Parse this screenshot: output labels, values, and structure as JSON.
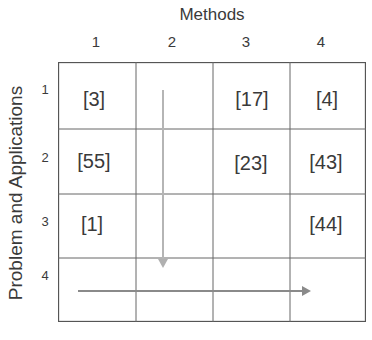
{
  "diagram": {
    "x_axis": {
      "title": "Methods",
      "labels": [
        "1",
        "2",
        "3",
        "4"
      ]
    },
    "y_axis": {
      "title": "Problem and Applications",
      "labels": [
        "1",
        "2",
        "3",
        "4"
      ]
    },
    "cells": {
      "r1c1": "[3]",
      "r1c3": "[17]",
      "r1c4": "[4]",
      "r2c1": "[55]",
      "r2c3": "[23]",
      "r2c4": "[43]",
      "r3c1": "[1]",
      "r3c4": "[44]"
    },
    "arrows": [
      {
        "name": "vertical-arrow",
        "direction": "down",
        "color": "#b0b0b0"
      },
      {
        "name": "horizontal-arrow",
        "direction": "right",
        "color": "#8a8a8a"
      }
    ],
    "colors": {
      "grid_line": "#555555",
      "text": "#3a3a3a"
    }
  }
}
